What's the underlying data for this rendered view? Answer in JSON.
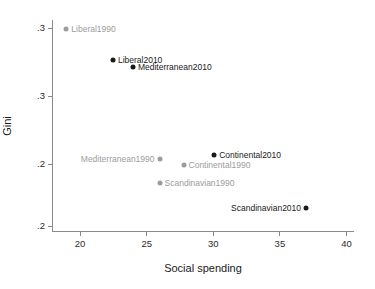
{
  "chart_data": {
    "type": "scatter",
    "title": "",
    "xlabel": "Social spending",
    "ylabel": "Gini",
    "xlim": [
      18,
      40.6
    ],
    "ylim": [
      0.196,
      0.3585
    ],
    "grid": false,
    "legend": null,
    "xticks": [
      {
        "value": 20,
        "label": "20"
      },
      {
        "value": 25,
        "label": "25"
      },
      {
        "value": 30,
        "label": "30"
      },
      {
        "value": 35,
        "label": "35"
      },
      {
        "value": 40,
        "label": "40"
      }
    ],
    "yticks": [
      {
        "value": 0.3525,
        "label": ".3"
      },
      {
        "value": 0.3,
        "label": ".3"
      },
      {
        "value": 0.2475,
        "label": ".2"
      },
      {
        "value": 0.2,
        "label": ".2"
      }
    ],
    "points": [
      {
        "name": "Liberal1990",
        "x": 19.0,
        "y": 0.3515,
        "color": "#9c9c9c",
        "series": "1990",
        "label_side": "right"
      },
      {
        "name": "Liberal2010",
        "x": 22.5,
        "y": 0.328,
        "color": "#1a1a1a",
        "series": "2010",
        "label_side": "right"
      },
      {
        "name": "Mediterranean2010",
        "x": 24.0,
        "y": 0.3225,
        "color": "#1a1a1a",
        "series": "2010",
        "label_side": "right"
      },
      {
        "name": "Mediterranean1990",
        "x": 26.0,
        "y": 0.2515,
        "color": "#9c9c9c",
        "series": "1990",
        "label_side": "left"
      },
      {
        "name": "Continental1990",
        "x": 27.8,
        "y": 0.247,
        "color": "#9c9c9c",
        "series": "1990",
        "label_side": "right"
      },
      {
        "name": "Continental2010",
        "x": 30.1,
        "y": 0.2545,
        "color": "#1a1a1a",
        "series": "2010",
        "label_side": "right"
      },
      {
        "name": "Scandinavian2010",
        "x": 37.0,
        "y": 0.2135,
        "color": "#1a1a1a",
        "series": "2010",
        "label_side": "left"
      },
      {
        "name": "Scandinavian1990",
        "x": 26.0,
        "y": 0.233,
        "color": "#9c9c9c",
        "series": "1990",
        "label_side": "right"
      }
    ],
    "colors": {
      "series_2010": "#1a1a1a",
      "series_1990": "#9c9c9c",
      "axis": "#8a8a8a",
      "text": "#1a1a1a",
      "background": "#ffffff"
    }
  }
}
